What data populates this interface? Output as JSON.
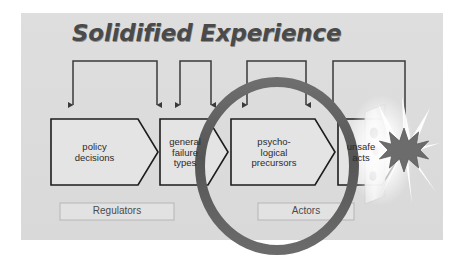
{
  "figure": {
    "title": "Solidified Experience",
    "background_color": "#dcdcdc",
    "line_color": "#3a3a3a",
    "ring_color": "#5d5d5d",
    "burst_color": "#6a6a6a",
    "panel_border_color": "#cfcfcf"
  },
  "nodes": [
    {
      "id": "policy-decisions",
      "label": "policy\ndecisions",
      "shape": "chevron"
    },
    {
      "id": "general-failure-types",
      "label": "general\nfailure\ntypes",
      "shape": "chevron"
    },
    {
      "id": "psychological-precursors",
      "label": "psycho-\nlogical\nprecursors",
      "shape": "chevron"
    },
    {
      "id": "unsafe-acts",
      "label": "unsafe\nacts",
      "shape": "chevron"
    }
  ],
  "groups": [
    {
      "id": "regulators",
      "label": "Regulators"
    },
    {
      "id": "actors",
      "label": "Actors"
    }
  ],
  "feedback_brackets": [
    {
      "id": "bracket-1",
      "target": "policy-decisions"
    },
    {
      "id": "bracket-2",
      "target": "general-failure-types"
    },
    {
      "id": "bracket-3",
      "target": "psychological-precursors"
    },
    {
      "id": "bracket-4",
      "target": "unsafe-acts"
    }
  ],
  "outcome": {
    "id": "accident",
    "barrier_label": "",
    "burst_label": ""
  }
}
